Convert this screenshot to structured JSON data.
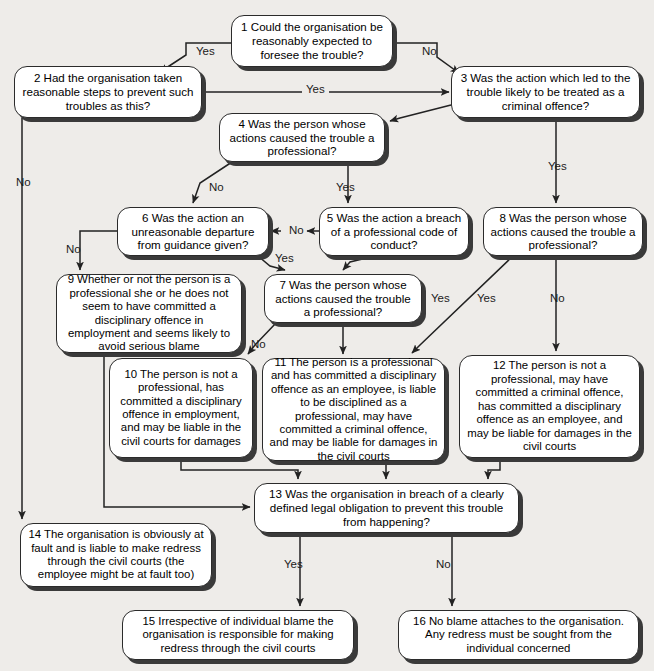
{
  "diagram": {
    "background_color": "#eeece9",
    "node_fill": "#ffffff",
    "node_border": "#2b2b2b",
    "shadow_color": "#3a3a3a"
  },
  "nodes": [
    {
      "id": "n1",
      "number": "1",
      "text": "1 Could the organisation be reasonably expected to foresee the trouble?",
      "x": 231,
      "y": 15,
      "w": 162,
      "h": 52,
      "font": 11.6
    },
    {
      "id": "n2",
      "number": "2",
      "text": "2 Had the organisation taken reasonable steps to prevent such troubles as this?",
      "x": 14,
      "y": 66,
      "w": 188,
      "h": 52,
      "font": 11.6
    },
    {
      "id": "n3",
      "number": "3",
      "text": "3 Was the action which led to the trouble likely to be treated as a criminal offence?",
      "x": 451,
      "y": 66,
      "w": 189,
      "h": 52,
      "font": 11.6
    },
    {
      "id": "n4",
      "number": "4",
      "text": "4 Was the person whose actions caused the trouble a professional?",
      "x": 219,
      "y": 113,
      "w": 166,
      "h": 49,
      "font": 11.6
    },
    {
      "id": "n5",
      "number": "5",
      "text": "5 Was the action a breach of a professional code of conduct?",
      "x": 319,
      "y": 207,
      "w": 150,
      "h": 49,
      "font": 11.6
    },
    {
      "id": "n6",
      "number": "6",
      "text": "6 Was the action an unreasonable departure from guidance given?",
      "x": 117,
      "y": 207,
      "w": 152,
      "h": 49,
      "font": 11.6
    },
    {
      "id": "n7",
      "number": "7",
      "text": "7 Was the person whose actions caused the trouble a professional?",
      "x": 264,
      "y": 274,
      "w": 158,
      "h": 49,
      "font": 11.6
    },
    {
      "id": "n8",
      "number": "8",
      "text": "8 Was the person whose actions caused the trouble a professional?",
      "x": 483,
      "y": 207,
      "w": 160,
      "h": 49,
      "font": 11.6
    },
    {
      "id": "n9",
      "number": "9",
      "text": "9 Whether or not the person is a professional she or he does not seem to have committed a disciplinary offence in employment and seems likely to avoid serious blame",
      "x": 56,
      "y": 274,
      "w": 186,
      "h": 79,
      "font": 11.4
    },
    {
      "id": "n10",
      "number": "10",
      "text": "10 The person is not a professional, has committed a disciplinary offence in employment, and may be liable in the civil courts for damages",
      "x": 109,
      "y": 358,
      "w": 144,
      "h": 100,
      "font": 11.4
    },
    {
      "id": "n11",
      "number": "11",
      "text": "11 The person is a professional and has committed a disciplinary offence as an employee, is liable to be disciplined as a professional, may have committed a criminal offence, and may be liable for damages in the civil courts",
      "x": 262,
      "y": 358,
      "w": 183,
      "h": 103,
      "font": 11.4
    },
    {
      "id": "n12",
      "number": "12",
      "text": "12 The person is not a professional, may have committed a criminal offence, has committed a disciplinary offence as an employee, and may be liable for damages in the civil courts",
      "x": 459,
      "y": 355,
      "w": 181,
      "h": 103,
      "font": 11.4
    },
    {
      "id": "n13",
      "number": "13",
      "text": "13 Was the organisation in breach of a clearly defined legal obligation to prevent this trouble from happening?",
      "x": 254,
      "y": 483,
      "w": 265,
      "h": 50,
      "font": 11.6
    },
    {
      "id": "n14",
      "number": "14",
      "text": "14 The organisation is obviously at fault and is liable to make redress through the civil courts (the employee might be at fault too)",
      "x": 20,
      "y": 523,
      "w": 192,
      "h": 64,
      "font": 11.4
    },
    {
      "id": "n15",
      "number": "15",
      "text": "15 Irrespective of individual blame the organisation is responsible for making redress through the civil courts",
      "x": 122,
      "y": 610,
      "w": 232,
      "h": 50,
      "font": 11.4
    },
    {
      "id": "n16",
      "number": "16",
      "text": "16 No blame attaches to the organisation. Any redress must be sought from the individual concerned",
      "x": 398,
      "y": 610,
      "w": 241,
      "h": 50,
      "font": 11.4
    }
  ],
  "edge_labels": [
    {
      "id": "e1-yes",
      "text": "Yes",
      "x": 196,
      "y": 45
    },
    {
      "id": "e1-no",
      "text": "No",
      "x": 422,
      "y": 45
    },
    {
      "id": "e2-yes",
      "text": "Yes",
      "x": 302,
      "y": 83
    },
    {
      "id": "e2-no",
      "text": "No",
      "x": 16,
      "y": 176
    },
    {
      "id": "e4-no",
      "text": "No",
      "x": 209,
      "y": 181
    },
    {
      "id": "e4-yes",
      "text": "Yes",
      "x": 336,
      "y": 181
    },
    {
      "id": "e3-yes",
      "text": "Yes",
      "x": 548,
      "y": 160
    },
    {
      "id": "e5-no",
      "text": "No",
      "x": 287,
      "y": 225
    },
    {
      "id": "e5-yes",
      "text": "Yes",
      "x": 275,
      "y": 253
    },
    {
      "id": "e6-no",
      "text": "No",
      "x": 66,
      "y": 243
    },
    {
      "id": "e7-no",
      "text": "No",
      "x": 251,
      "y": 338
    },
    {
      "id": "e7-yes",
      "text": "Yes",
      "x": 431,
      "y": 292
    },
    {
      "id": "e8-yes",
      "text": "Yes",
      "x": 477,
      "y": 292
    },
    {
      "id": "e8-no",
      "text": "No",
      "x": 550,
      "y": 292
    },
    {
      "id": "e13-yes",
      "text": "Yes",
      "x": 284,
      "y": 558
    },
    {
      "id": "e13-no",
      "text": "No",
      "x": 436,
      "y": 558
    }
  ]
}
